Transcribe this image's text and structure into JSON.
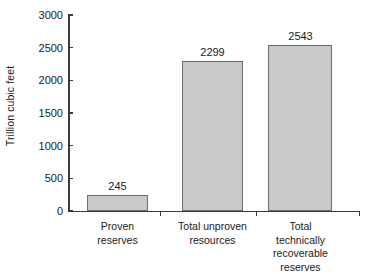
{
  "chart_data": {
    "type": "bar",
    "title": "",
    "xlabel": "",
    "ylabel": "Trillion cubic feet",
    "ylim": [
      0,
      3000
    ],
    "grid": false,
    "legend": false,
    "categories": [
      "Proven reserves",
      "Total unproven resources",
      "Total technically recoverable reserves"
    ],
    "values": [
      245,
      2299,
      2543
    ],
    "value_labels": [
      "245",
      "2299",
      "2543"
    ],
    "ytick_labels": [
      "3000",
      "2500",
      "2000",
      "1500",
      "1000",
      "500",
      "0"
    ],
    "ytick_values": [
      3000,
      2500,
      2000,
      1500,
      1000,
      500,
      0
    ],
    "category_lines": [
      [
        "Proven",
        "reserves"
      ],
      [
        "Total unproven",
        "resources"
      ],
      [
        "Total technically",
        "recoverable reserves"
      ]
    ],
    "colors": {
      "bar_fill": "#c9c9c9",
      "bar_border": "#6e6e6e",
      "axis": "#3a3a3a",
      "text": "#1a1a1a",
      "background": "#ffffff"
    }
  }
}
